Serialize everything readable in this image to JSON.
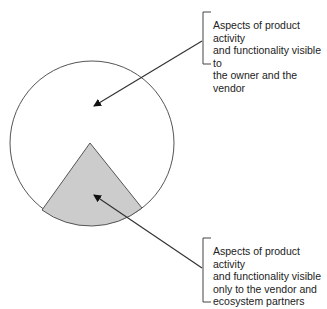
{
  "diagram": {
    "colors": {
      "stroke": "#555555",
      "circle_fill": "#ffffff",
      "wedge_fill": "#cccccc",
      "arrow": "#333333",
      "text": "#222222"
    },
    "circle": {
      "cx": 92,
      "cy": 143,
      "r": 82
    },
    "wedge": {
      "apex": [
        90,
        143
      ],
      "left": [
        42,
        210
      ],
      "right": [
        142,
        208
      ]
    },
    "labels": {
      "top": {
        "lines": [
          "Aspects of product activity",
          "and functionality visible to",
          "the owner and the vendor"
        ],
        "text": "Aspects of product activity\nand functionality visible to\nthe owner and the vendor"
      },
      "bottom": {
        "lines": [
          "Aspects of product activity",
          "and functionality visible",
          "only to the vendor and",
          "ecosystem partners"
        ],
        "text": "Aspects of product activity\nand functionality visible\nonly to the vendor and\necosystem partners"
      }
    }
  }
}
